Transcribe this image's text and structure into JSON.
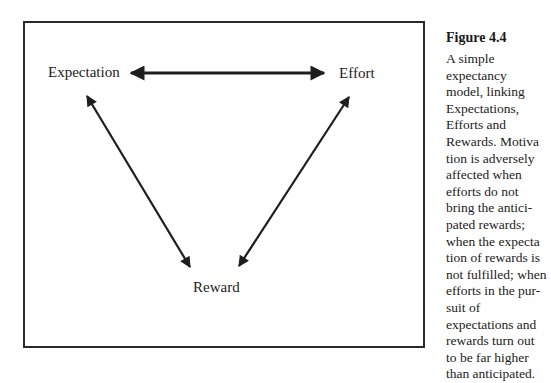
{
  "figure": {
    "title": "Figure 4.4",
    "caption_lines": [
      "A simple",
      "expectancy",
      "model, linking",
      "Expectations,",
      "Efforts and",
      "Rewards. Motiva",
      "tion is adversely",
      "affected when",
      "efforts do not",
      "bring the antici-",
      "pated rewards;",
      "when the expecta",
      "tion of rewards is",
      "not fulfilled; when",
      "efforts in the pur-",
      "suit of",
      "expectations and",
      "rewards turn out",
      "to be far higher",
      "than anticipated."
    ]
  },
  "diagram": {
    "nodes": {
      "expectation": "Expectation",
      "effort": "Effort",
      "reward": "Reward"
    },
    "edges": [
      {
        "from": "Expectation",
        "to": "Effort",
        "direction": "bidirectional"
      },
      {
        "from": "Expectation",
        "to": "Reward",
        "direction": "bidirectional"
      },
      {
        "from": "Effort",
        "to": "Reward",
        "direction": "bidirectional"
      }
    ],
    "stroke_color": "#1e1e1e"
  }
}
